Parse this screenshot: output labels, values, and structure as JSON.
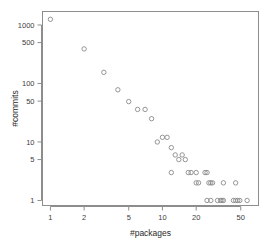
{
  "chart_data": {
    "type": "scatter",
    "title": "",
    "xlabel": "#packages",
    "ylabel": "#commits",
    "xscale": "log",
    "yscale": "log",
    "xlim": [
      0.85,
      72
    ],
    "ylim": [
      0.82,
      1700
    ],
    "grid": false,
    "legend": null,
    "marker": "open-circle",
    "marker_color": "#8a8a8a",
    "xticks": [
      1,
      2,
      5,
      10,
      20,
      50
    ],
    "xticklabels": [
      "1",
      "2",
      "5",
      "10",
      "20",
      "50"
    ],
    "yticks": [
      1,
      5,
      10,
      50,
      100,
      500,
      1000
    ],
    "yticklabels": [
      "1",
      "5",
      "10",
      "50",
      "100",
      "500",
      "1000"
    ],
    "points": [
      {
        "x": 1,
        "y": 1250
      },
      {
        "x": 2,
        "y": 390
      },
      {
        "x": 3,
        "y": 155
      },
      {
        "x": 4,
        "y": 78
      },
      {
        "x": 5,
        "y": 49
      },
      {
        "x": 6,
        "y": 36
      },
      {
        "x": 7,
        "y": 36
      },
      {
        "x": 8,
        "y": 25
      },
      {
        "x": 9,
        "y": 10
      },
      {
        "x": 10,
        "y": 12
      },
      {
        "x": 11,
        "y": 12
      },
      {
        "x": 12,
        "y": 8
      },
      {
        "x": 13,
        "y": 6
      },
      {
        "x": 14,
        "y": 5
      },
      {
        "x": 15,
        "y": 6
      },
      {
        "x": 16,
        "y": 5
      },
      {
        "x": 12,
        "y": 3
      },
      {
        "x": 17,
        "y": 3
      },
      {
        "x": 18,
        "y": 3
      },
      {
        "x": 20,
        "y": 3
      },
      {
        "x": 24,
        "y": 3
      },
      {
        "x": 25,
        "y": 3
      },
      {
        "x": 20,
        "y": 2
      },
      {
        "x": 21,
        "y": 2
      },
      {
        "x": 26,
        "y": 2
      },
      {
        "x": 27,
        "y": 2
      },
      {
        "x": 28,
        "y": 2
      },
      {
        "x": 35,
        "y": 2
      },
      {
        "x": 45,
        "y": 2
      },
      {
        "x": 25,
        "y": 1
      },
      {
        "x": 27,
        "y": 1
      },
      {
        "x": 31,
        "y": 1
      },
      {
        "x": 33,
        "y": 1
      },
      {
        "x": 34,
        "y": 1
      },
      {
        "x": 35,
        "y": 1
      },
      {
        "x": 43,
        "y": 1
      },
      {
        "x": 45,
        "y": 1
      },
      {
        "x": 47,
        "y": 1
      },
      {
        "x": 49,
        "y": 1
      },
      {
        "x": 57,
        "y": 1
      }
    ]
  }
}
